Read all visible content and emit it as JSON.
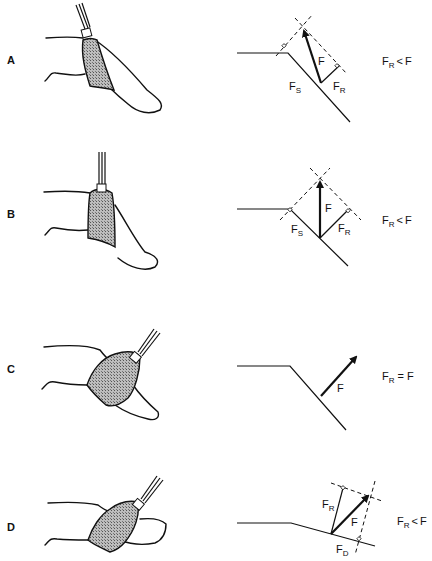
{
  "figure": {
    "panels": [
      {
        "id": "A",
        "label": "A",
        "vectors": {
          "F": "F",
          "FS_main": "F",
          "FS_sub": "S",
          "FR_main": "F",
          "FR_sub": "R"
        },
        "relation": {
          "lhs_main": "F",
          "lhs_sub": "R",
          "op": "<",
          "rhs": "F"
        }
      },
      {
        "id": "B",
        "label": "B",
        "vectors": {
          "F": "F",
          "FS_main": "F",
          "FS_sub": "S",
          "FR_main": "F",
          "FR_sub": "R"
        },
        "relation": {
          "lhs_main": "F",
          "lhs_sub": "R",
          "op": "<",
          "rhs": "F"
        }
      },
      {
        "id": "C",
        "label": "C",
        "vectors": {
          "F": "F"
        },
        "relation": {
          "lhs_main": "F",
          "lhs_sub": "R",
          "op": "=",
          "rhs": "F"
        }
      },
      {
        "id": "D",
        "label": "D",
        "vectors": {
          "F": "F",
          "FR_main": "F",
          "FR_sub": "R",
          "FD_main": "F",
          "FD_sub": "D"
        },
        "relation": {
          "lhs_main": "F",
          "lhs_sub": "R",
          "op": "<",
          "rhs": "F"
        }
      }
    ],
    "colors": {
      "ink": "#111111",
      "background": "#ffffff",
      "shade": "#9a9a9a"
    }
  }
}
